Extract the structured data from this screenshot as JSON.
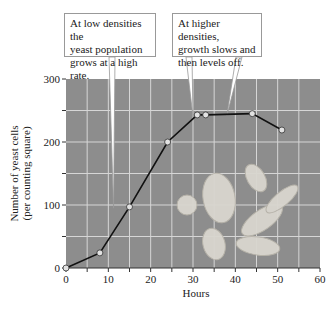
{
  "chart_data": {
    "type": "line",
    "title": "",
    "xlabel": "Hours",
    "ylabel": "Number of yeast cells\n(per counting square)",
    "ylabel_lines": [
      "Number of yeast cells",
      "(per counting square)"
    ],
    "xlim": [
      0,
      60
    ],
    "ylim": [
      0,
      300
    ],
    "x_ticks": [
      0,
      10,
      20,
      30,
      40,
      50,
      60
    ],
    "y_ticks": [
      0,
      100,
      200,
      300
    ],
    "grid": true,
    "grid_x_step": 5,
    "grid_y_step": 50,
    "series": [
      {
        "name": "Yeast population",
        "x": [
          0,
          8,
          15,
          24,
          31,
          33,
          44,
          51
        ],
        "values": [
          0,
          24,
          97,
          200,
          243,
          243,
          245,
          219
        ]
      }
    ],
    "annotations": [
      {
        "text": "At low densities the\nyeast population\ngrows at a high rate.",
        "points_to_x": [
          11
        ]
      },
      {
        "text": "At higher densities,\ngrowth slows and\nthen levels off.",
        "points_to_x": [
          30,
          38
        ]
      }
    ],
    "background_image": "yeast cells micrograph"
  },
  "callouts": {
    "low": "At low densities the\nyeast population\ngrows at a high rate.",
    "high": "At higher densities,\ngrowth slows and\nthen levels off."
  },
  "colors": {
    "plot_bg": "#8d8d8d",
    "grid": "#d6d6d6",
    "line": "#111111",
    "marker_fill": "#e2e2e2",
    "cell_fill": "#d9d6cf"
  }
}
